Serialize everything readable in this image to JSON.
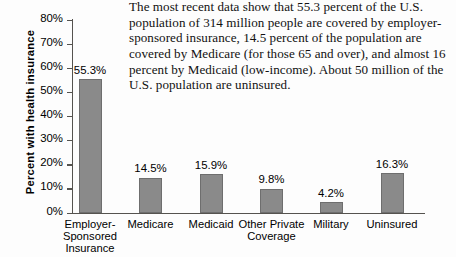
{
  "caption": {
    "text": "The most recent data show that 55.3 percent of the U.S. population of 314 million people are covered by employer-sponsored insurance, 14.5 percent of the population are covered by Medicare (for those 65 and over), and almost 16 percent by Medicaid (low-income). About 50 million of the U.S. population are uninsured."
  },
  "chart_data": {
    "type": "bar",
    "title": "",
    "xlabel": "",
    "ylabel": "Percent  with health insurance",
    "categories": [
      "Employer-\nSponsored\nInsurance",
      "Medicare",
      "Medicaid",
      "Other Private\nCoverage",
      "Military",
      "Uninsured"
    ],
    "values": [
      55.3,
      14.5,
      15.9,
      9.8,
      4.2,
      16.3
    ],
    "value_labels": [
      "55.3%",
      "14.5%",
      "15.9%",
      "9.8%",
      "4.2%",
      "16.3%"
    ],
    "ylim": [
      0,
      80
    ],
    "yticks": [
      0,
      10,
      20,
      30,
      40,
      50,
      60,
      70,
      80
    ],
    "ytick_labels": [
      "0%",
      "10%",
      "20%",
      "30%",
      "40%",
      "50%",
      "60%",
      "70%",
      "80%"
    ],
    "grid": false,
    "legend": false,
    "bar_color": "#8a8a8a",
    "axis_color": "#55534f"
  }
}
